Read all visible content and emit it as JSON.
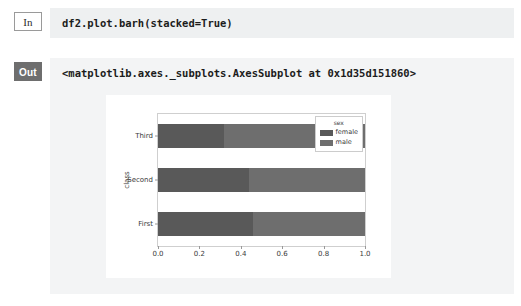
{
  "notebook": {
    "input_cell": {
      "prompt_label": "In",
      "code": "df2.plot.barh(stacked=True)"
    },
    "output_cell": {
      "prompt_label": "Out",
      "repr_text": "<matplotlib.axes._subplots.AxesSubplot at 0x1d35d151860>"
    }
  },
  "chart_data": {
    "type": "bar",
    "orientation": "horizontal",
    "stacked": true,
    "title": "",
    "xlabel": "",
    "ylabel": "class",
    "categories": [
      "First",
      "Second",
      "Third"
    ],
    "category_order_top_to_bottom": [
      "Third",
      "Second",
      "First"
    ],
    "series": [
      {
        "name": "female",
        "values": [
          0.46,
          0.44,
          0.32
        ],
        "color": "#595959"
      },
      {
        "name": "male",
        "values": [
          0.54,
          0.56,
          0.68
        ],
        "color": "#6e6e6e"
      }
    ],
    "legend": {
      "title": "sex",
      "position": "upper right",
      "entries": [
        {
          "label": "female",
          "color": "#595959"
        },
        {
          "label": "male",
          "color": "#6e6e6e"
        }
      ]
    },
    "xlim": [
      0.0,
      1.0
    ],
    "xticks": [
      "0.0",
      "0.2",
      "0.4",
      "0.6",
      "0.8",
      "1.0"
    ],
    "xtick_values": [
      0.0,
      0.2,
      0.4,
      0.6,
      0.8,
      1.0
    ],
    "grid": false
  },
  "colors": {
    "female": "#595959",
    "male": "#6e6e6e",
    "input_background": "#eef0f1",
    "output_background": "#f3f4f5",
    "figure_background": "#ffffff",
    "prompt_out_background": "#6e6e6e",
    "axes_spine": "#cfcfcf"
  }
}
